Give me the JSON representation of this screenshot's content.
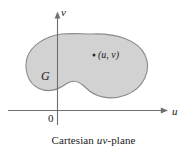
{
  "figure": {
    "caption_prefix": "Cartesian ",
    "caption_vars": "uv",
    "caption_suffix": "-plane",
    "caption_full": "Cartesian uv-plane",
    "axes": {
      "vertical_label": "v",
      "horizontal_label": "u",
      "origin_label": "0"
    },
    "region": {
      "label": "G",
      "fill_color": "#d2d2d2",
      "stroke_color": "#8a8a8a"
    },
    "point": {
      "label": "(u, v)",
      "marker": "dot-marker"
    },
    "colors": {
      "background": "#ffffff",
      "axis": "#6e6e6e",
      "text": "#1a1a1a"
    }
  }
}
